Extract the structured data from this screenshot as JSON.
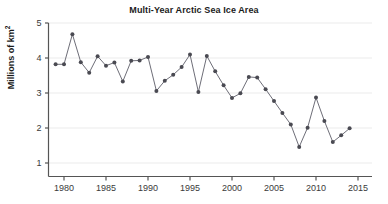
{
  "chart_data": {
    "type": "line",
    "title": "Multi-Year Arctic Sea Ice Area",
    "xlabel": "",
    "ylabel": "Millions of km²",
    "ylabel_main": "Millions of km",
    "ylabel_sup": "2",
    "xlim": [
      1978.2,
      2015.6
    ],
    "ylim": [
      0.62,
      5.1
    ],
    "xticks": [
      1980,
      1985,
      1990,
      1995,
      2000,
      2005,
      2010,
      2015
    ],
    "xtick_labels": [
      "1980",
      "1985",
      "1990",
      "1995",
      "2000",
      "2005",
      "2010",
      "2015"
    ],
    "yticks": [
      1,
      2,
      3,
      4,
      5
    ],
    "ytick_labels": [
      "1",
      "2",
      "3",
      "4",
      "5"
    ],
    "grid": "horizontal",
    "grid_color": "#ebebeb",
    "legend": "none",
    "line_color": "#6e6e78",
    "marker_color": "#4a4a52",
    "marker": "circle",
    "x": [
      1979,
      1980,
      1981,
      1982,
      1983,
      1984,
      1985,
      1986,
      1987,
      1988,
      1989,
      1990,
      1991,
      1992,
      1993,
      1994,
      1995,
      1996,
      1997,
      1998,
      1999,
      2000,
      2001,
      2002,
      2003,
      2004,
      2005,
      2006,
      2007,
      2008,
      2009,
      2010,
      2011,
      2012,
      2013,
      2014
    ],
    "values": [
      3.82,
      3.82,
      4.68,
      3.88,
      3.58,
      4.05,
      3.78,
      3.87,
      3.33,
      3.92,
      3.93,
      4.03,
      3.06,
      3.35,
      3.52,
      3.74,
      4.1,
      3.03,
      4.06,
      3.62,
      3.22,
      2.86,
      2.99,
      3.46,
      3.44,
      3.11,
      2.77,
      2.43,
      2.1,
      1.46,
      2.01,
      2.87,
      2.2,
      1.6,
      1.79,
      1.99
    ],
    "series": [
      {
        "name": "Multi-Year Arctic Sea Ice Area",
        "values": [
          3.82,
          3.82,
          4.68,
          3.88,
          3.58,
          4.05,
          3.78,
          3.87,
          3.33,
          3.92,
          3.93,
          4.03,
          3.06,
          3.35,
          3.52,
          3.74,
          4.1,
          3.03,
          4.06,
          3.62,
          3.22,
          2.86,
          2.99,
          3.46,
          3.44,
          3.11,
          2.77,
          2.43,
          2.1,
          1.46,
          2.01,
          2.87,
          2.2,
          1.6,
          1.79,
          1.99
        ]
      }
    ]
  }
}
